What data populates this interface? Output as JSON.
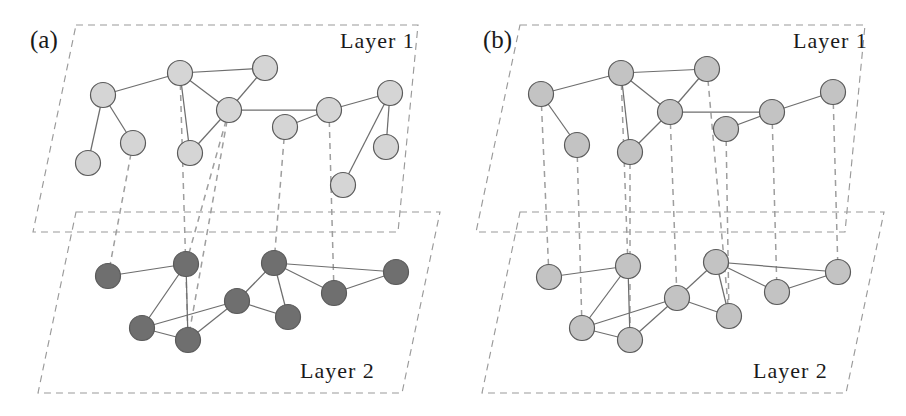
{
  "figure": {
    "width": 906,
    "height": 416,
    "background": "#ffffff"
  },
  "style": {
    "node_light_fill": "#d5d5d5",
    "node_dark_fill": "#6f6f6f",
    "node_mid_fill": "#c3c3c3",
    "node_stroke": "#5a5a5a",
    "intra_edge_color": "#6e6e6e",
    "inter_edge_color": "#9e9e9e",
    "frame_color": "#9a9a9a",
    "node_radius": 12.5
  },
  "panels": [
    {
      "id": "a",
      "label": "(a)",
      "label_x": 30,
      "label_y": 48,
      "origin_x": 0,
      "layers": [
        {
          "id": "layer1",
          "name": "Layer 1",
          "label_x": 340,
          "label_y": 48,
          "node_class": "node-light",
          "frame": "76,25 418,25 398,232 33,232",
          "nodes": [
            {
              "id": "a1n0",
              "x": 103,
              "y": 95
            },
            {
              "id": "a1n1",
              "x": 88,
              "y": 163
            },
            {
              "id": "a1n2",
              "x": 133,
              "y": 143
            },
            {
              "id": "a1n3",
              "x": 180,
              "y": 73
            },
            {
              "id": "a1n4",
              "x": 190,
              "y": 153
            },
            {
              "id": "a1n5",
              "x": 265,
              "y": 68
            },
            {
              "id": "a1n6",
              "x": 229,
              "y": 110
            },
            {
              "id": "a1n7",
              "x": 285,
              "y": 127
            },
            {
              "id": "a1n8",
              "x": 329,
              "y": 110
            },
            {
              "id": "a1n9",
              "x": 390,
              "y": 93
            },
            {
              "id": "a1n10",
              "x": 386,
              "y": 147
            },
            {
              "id": "a1n11",
              "x": 343,
              "y": 185
            }
          ],
          "edges": [
            [
              "a1n0",
              "a1n3"
            ],
            [
              "a1n0",
              "a1n1"
            ],
            [
              "a1n0",
              "a1n2"
            ],
            [
              "a1n3",
              "a1n5"
            ],
            [
              "a1n3",
              "a1n4"
            ],
            [
              "a1n3",
              "a1n6"
            ],
            [
              "a1n6",
              "a1n5"
            ],
            [
              "a1n6",
              "a1n4"
            ],
            [
              "a1n6",
              "a1n8"
            ],
            [
              "a1n8",
              "a1n7"
            ],
            [
              "a1n8",
              "a1n9"
            ],
            [
              "a1n9",
              "a1n10"
            ],
            [
              "a1n9",
              "a1n11"
            ]
          ]
        },
        {
          "id": "layer2",
          "name": "Layer 2",
          "label_x": 300,
          "label_y": 378,
          "node_class": "node-dark",
          "frame": "76,212 440,212 402,393 38,393",
          "nodes": [
            {
              "id": "a2n0",
              "x": 108,
              "y": 276
            },
            {
              "id": "a2n1",
              "x": 186,
              "y": 264
            },
            {
              "id": "a2n2",
              "x": 142,
              "y": 328
            },
            {
              "id": "a2n3",
              "x": 188,
              "y": 340
            },
            {
              "id": "a2n4",
              "x": 237,
              "y": 301
            },
            {
              "id": "a2n5",
              "x": 274,
              "y": 263
            },
            {
              "id": "a2n6",
              "x": 288,
              "y": 317
            },
            {
              "id": "a2n7",
              "x": 334,
              "y": 293
            },
            {
              "id": "a2n8",
              "x": 396,
              "y": 272
            }
          ],
          "edges": [
            [
              "a2n0",
              "a2n1"
            ],
            [
              "a2n1",
              "a2n2"
            ],
            [
              "a2n1",
              "a2n3"
            ],
            [
              "a2n2",
              "a2n3"
            ],
            [
              "a2n2",
              "a2n4"
            ],
            [
              "a2n3",
              "a2n4"
            ],
            [
              "a2n4",
              "a2n5"
            ],
            [
              "a2n4",
              "a2n6"
            ],
            [
              "a2n5",
              "a2n6"
            ],
            [
              "a2n5",
              "a2n7"
            ],
            [
              "a2n5",
              "a2n8"
            ],
            [
              "a2n7",
              "a2n8"
            ]
          ]
        }
      ],
      "inter_edges": [
        [
          "a1n2",
          "a2n0"
        ],
        [
          "a1n3",
          "a2n3"
        ],
        [
          "a1n6",
          "a2n1"
        ],
        [
          "a1n6",
          "a2n3"
        ],
        [
          "a1n7",
          "a2n5"
        ],
        [
          "a1n8",
          "a2n7"
        ]
      ]
    },
    {
      "id": "b",
      "label": "(b)",
      "label_x": 483,
      "label_y": 48,
      "origin_x": 453,
      "layers": [
        {
          "id": "layer1",
          "name": "Layer 1",
          "label_x": 793,
          "label_y": 48,
          "node_class": "node-mid",
          "frame": "520,25 865,25 845,232 476,232",
          "nodes": [
            {
              "id": "b1n0",
              "x": 541,
              "y": 94
            },
            {
              "id": "b1n1",
              "x": 577,
              "y": 145
            },
            {
              "id": "b1n2",
              "x": 621,
              "y": 73
            },
            {
              "id": "b1n3",
              "x": 630,
              "y": 152
            },
            {
              "id": "b1n4",
              "x": 670,
              "y": 112
            },
            {
              "id": "b1n5",
              "x": 707,
              "y": 69
            },
            {
              "id": "b1n6",
              "x": 726,
              "y": 129
            },
            {
              "id": "b1n7",
              "x": 772,
              "y": 112
            },
            {
              "id": "b1n8",
              "x": 833,
              "y": 92
            }
          ],
          "edges": [
            [
              "b1n0",
              "b1n2"
            ],
            [
              "b1n0",
              "b1n1"
            ],
            [
              "b1n2",
              "b1n5"
            ],
            [
              "b1n2",
              "b1n3"
            ],
            [
              "b1n2",
              "b1n4"
            ],
            [
              "b1n4",
              "b1n5"
            ],
            [
              "b1n4",
              "b1n3"
            ],
            [
              "b1n4",
              "b1n7"
            ],
            [
              "b1n7",
              "b1n6"
            ],
            [
              "b1n7",
              "b1n8"
            ]
          ]
        },
        {
          "id": "layer2",
          "name": "Layer 2",
          "label_x": 753,
          "label_y": 378,
          "node_class": "node-mid",
          "frame": "520,212 884,212 846,393 482,393",
          "nodes": [
            {
              "id": "b2n0",
              "x": 549,
              "y": 277
            },
            {
              "id": "b2n1",
              "x": 628,
              "y": 266
            },
            {
              "id": "b2n2",
              "x": 582,
              "y": 328
            },
            {
              "id": "b2n3",
              "x": 630,
              "y": 340
            },
            {
              "id": "b2n4",
              "x": 677,
              "y": 298
            },
            {
              "id": "b2n5",
              "x": 716,
              "y": 262
            },
            {
              "id": "b2n6",
              "x": 729,
              "y": 316
            },
            {
              "id": "b2n7",
              "x": 777,
              "y": 292
            },
            {
              "id": "b2n8",
              "x": 838,
              "y": 272
            }
          ],
          "edges": [
            [
              "b2n0",
              "b2n1"
            ],
            [
              "b2n1",
              "b2n2"
            ],
            [
              "b2n1",
              "b2n3"
            ],
            [
              "b2n2",
              "b2n3"
            ],
            [
              "b2n2",
              "b2n4"
            ],
            [
              "b2n3",
              "b2n4"
            ],
            [
              "b2n4",
              "b2n5"
            ],
            [
              "b2n4",
              "b2n6"
            ],
            [
              "b2n5",
              "b2n6"
            ],
            [
              "b2n5",
              "b2n7"
            ],
            [
              "b2n5",
              "b2n8"
            ],
            [
              "b2n7",
              "b2n8"
            ]
          ]
        }
      ],
      "inter_edges": [
        [
          "b1n0",
          "b2n0"
        ],
        [
          "b1n1",
          "b2n2"
        ],
        [
          "b1n2",
          "b2n1"
        ],
        [
          "b1n3",
          "b2n3"
        ],
        [
          "b1n4",
          "b2n4"
        ],
        [
          "b1n5",
          "b2n6"
        ],
        [
          "b1n6",
          "b2n6"
        ],
        [
          "b1n7",
          "b2n7"
        ],
        [
          "b1n8",
          "b2n8"
        ]
      ]
    }
  ]
}
